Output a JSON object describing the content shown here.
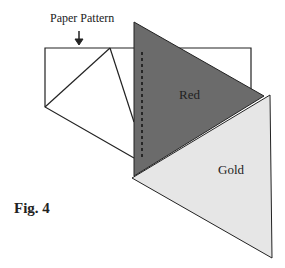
{
  "labels": {
    "paper_pattern": "Paper Pattern",
    "red": "Red",
    "gold": "Gold",
    "figure": "Fig. 4"
  },
  "colors": {
    "red_fill": "#6b6b6b",
    "gold_fill": "#e6e6e6",
    "line": "#222222"
  }
}
